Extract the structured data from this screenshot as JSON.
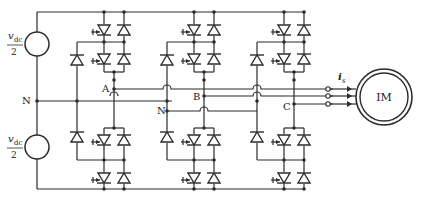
{
  "diagram": {
    "type": "circuit-schematic",
    "sources": [
      {
        "id": "upper",
        "label_num": "v",
        "label_sub": "dc",
        "label_den": "2"
      },
      {
        "id": "lower",
        "label_num": "v",
        "label_sub": "dc",
        "label_den": "2"
      }
    ],
    "node_labels": {
      "neutral_left": "N",
      "neutral_mid": "N",
      "phase_a": "A",
      "phase_b": "B",
      "phase_c": "C"
    },
    "current_label": {
      "main": "i",
      "sub": "s"
    },
    "motor_label": "IM",
    "phases": [
      "A",
      "B",
      "C"
    ],
    "components_per_phase": {
      "switches": 4,
      "antiparallel_diodes": 4,
      "clamp_diodes": 2
    },
    "colors": {
      "stroke": "#2b2b2b",
      "background": "#ffffff"
    }
  }
}
